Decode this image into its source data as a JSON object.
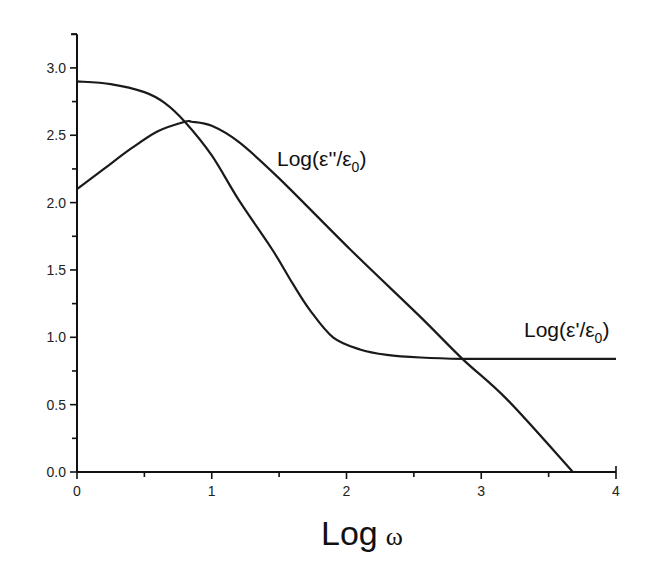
{
  "chart_data": {
    "type": "line",
    "title": "",
    "xlabel": "Log ω",
    "ylabel": "",
    "xlim": [
      0,
      4
    ],
    "ylim": [
      0,
      3.25
    ],
    "grid": false,
    "legend": "none (inline curve labels)",
    "x_ticks": [
      "0",
      "1",
      "2",
      "3",
      "4"
    ],
    "y_ticks": [
      "0.0",
      "0.5",
      "1.0",
      "1.5",
      "2.0",
      "2.5",
      "3.0"
    ],
    "x_minor_step": 0.5,
    "y_minor_step": 0.25,
    "series": [
      {
        "name": "Log(ε'/ε0)",
        "label_main": "Log(ε'/ε",
        "label_sub": "0",
        "label_close": ")",
        "x": [
          0.0,
          0.25,
          0.5,
          0.65,
          0.8,
          1.0,
          1.2,
          1.45,
          1.6,
          1.73,
          1.9,
          2.1,
          2.3,
          2.55,
          2.86,
          3.2,
          3.6,
          4.0
        ],
        "y": [
          2.9,
          2.88,
          2.82,
          2.74,
          2.6,
          2.35,
          2.02,
          1.65,
          1.4,
          1.2,
          1.0,
          0.91,
          0.87,
          0.85,
          0.84,
          0.84,
          0.84,
          0.84
        ]
      },
      {
        "name": "Log(ε''/ε0)",
        "label_main": "Log(ε''/ε",
        "label_sub": "0",
        "label_close": ")",
        "x": [
          0.0,
          0.2,
          0.4,
          0.6,
          0.8,
          0.85,
          1.0,
          1.2,
          1.5,
          2.03,
          2.55,
          2.86,
          3.2,
          3.68
        ],
        "y": [
          2.1,
          2.25,
          2.4,
          2.53,
          2.6,
          2.6,
          2.57,
          2.45,
          2.18,
          1.65,
          1.15,
          0.84,
          0.53,
          0.0
        ]
      }
    ],
    "annotations": [
      {
        "text": "Log(ε''/ε0)",
        "x": 1.5,
        "y": 2.25
      },
      {
        "text": "Log(ε'/ε0)",
        "x": 3.45,
        "y": 1.05
      }
    ]
  }
}
